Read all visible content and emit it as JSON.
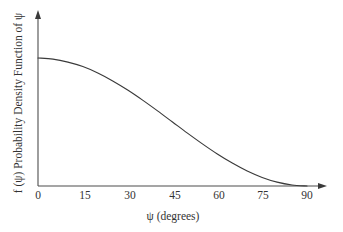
{
  "chart_data": {
    "type": "line",
    "title": "",
    "xlabel": "ψ (degrees)",
    "ylabel": "f (ψ) Probability Density Function of ψ",
    "xlim": [
      0,
      90
    ],
    "ylim": [
      0,
      1
    ],
    "grid": false,
    "legend": null,
    "xticks": [
      "0",
      "15",
      "30",
      "45",
      "60",
      "75",
      "90"
    ],
    "xtick_values": [
      0,
      15,
      30,
      45,
      60,
      75,
      90
    ],
    "yticks": [],
    "x": [
      0,
      5,
      10,
      15,
      20,
      25,
      30,
      35,
      40,
      45,
      50,
      55,
      60,
      65,
      70,
      75,
      80,
      85,
      90
    ],
    "series": [
      {
        "name": "f(ψ)",
        "values": [
          1.0,
          0.991,
          0.968,
          0.933,
          0.883,
          0.821,
          0.75,
          0.671,
          0.587,
          0.5,
          0.413,
          0.329,
          0.25,
          0.179,
          0.117,
          0.067,
          0.03,
          0.008,
          0.0
        ]
      }
    ],
    "curve_color": "#3a3a3a",
    "axis_color": "#4d4d4d",
    "background_color": "#ffffff"
  },
  "axes": {
    "x_axis_name": "x-axis",
    "y_axis_name": "y-axis",
    "x_arrow": "arrow-right",
    "y_arrow": "arrow-up"
  }
}
